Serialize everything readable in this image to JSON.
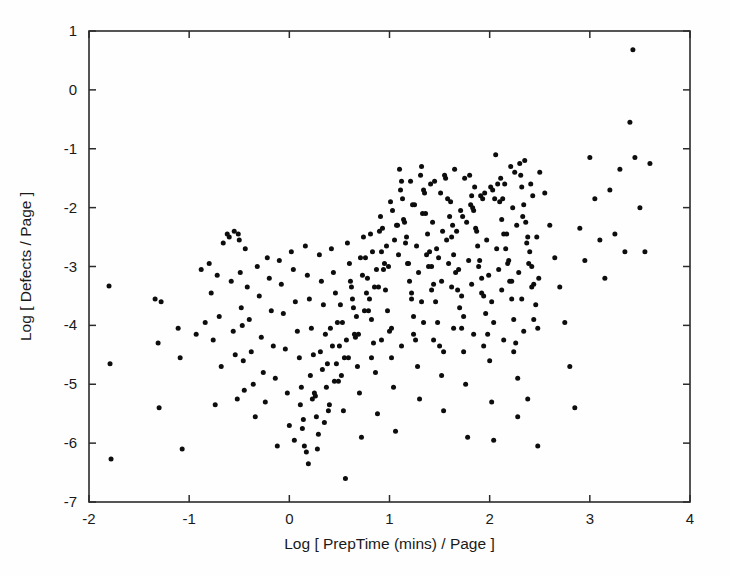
{
  "figure": {
    "background_color": "#fefefe",
    "foreground_color": "#1a1a1a",
    "marker_color": "#0d0d0d"
  },
  "axes": {
    "x_title": "Log [ PrepTime (mins) / Page ]",
    "y_title": "Log [ Defects / Page ]",
    "x_ticks": [
      "-2",
      "-1",
      "0",
      "1",
      "2",
      "3",
      "4"
    ],
    "y_ticks": [
      "1",
      "0",
      "-1",
      "-2",
      "-3",
      "-4",
      "-5",
      "-6",
      "-7"
    ]
  },
  "chart_data": {
    "type": "scatter",
    "title": "",
    "xlabel": "Log [ PrepTime (mins) / Page ]",
    "ylabel": "Log [ Defects / Page ]",
    "xlim": [
      -2,
      4
    ],
    "ylim": [
      -7,
      1
    ],
    "xticks": [
      -2,
      -1,
      0,
      1,
      2,
      3,
      4
    ],
    "yticks": [
      -7,
      -6,
      -5,
      -4,
      -3,
      -2,
      -1,
      0,
      1
    ],
    "grid": false,
    "legend": null,
    "marker": "filled-circle",
    "marker_size_px": 5,
    "n_points": 380,
    "x": [
      -1.8,
      -1.79,
      -1.78,
      -1.34,
      -1.31,
      -1.3,
      -1.28,
      -1.11,
      -1.09,
      -1.07,
      -0.93,
      -0.88,
      -0.84,
      -0.8,
      -0.78,
      -0.76,
      -0.74,
      -0.72,
      -0.7,
      -0.68,
      -0.66,
      -0.62,
      -0.6,
      -0.58,
      -0.56,
      -0.54,
      -0.52,
      -0.5,
      -0.49,
      -0.48,
      -0.47,
      -0.46,
      -0.45,
      -0.44,
      -0.42,
      -0.4,
      -0.38,
      -0.36,
      -0.34,
      -0.32,
      -0.3,
      -0.28,
      -0.26,
      -0.24,
      -0.22,
      -0.2,
      -0.18,
      -0.16,
      -0.14,
      -0.12,
      -0.1,
      -0.08,
      -0.06,
      -0.04,
      -0.02,
      0.0,
      0.02,
      0.04,
      0.06,
      0.08,
      0.1,
      0.12,
      0.14,
      0.16,
      0.18,
      0.2,
      0.22,
      0.24,
      0.26,
      0.28,
      0.3,
      0.32,
      0.34,
      0.36,
      0.38,
      0.4,
      0.42,
      0.44,
      0.46,
      0.48,
      0.5,
      0.52,
      0.54,
      0.56,
      0.58,
      0.6,
      0.62,
      0.64,
      0.66,
      0.68,
      0.7,
      0.72,
      0.74,
      0.76,
      0.78,
      0.8,
      0.82,
      0.84,
      0.86,
      0.88,
      0.9,
      0.92,
      0.94,
      0.96,
      0.98,
      1.0,
      1.02,
      1.04,
      1.06,
      1.08,
      1.1,
      1.12,
      1.14,
      1.16,
      1.18,
      1.2,
      1.22,
      1.24,
      1.26,
      1.28,
      1.3,
      1.32,
      1.34,
      1.36,
      1.38,
      1.4,
      1.42,
      1.44,
      1.46,
      1.48,
      1.5,
      1.52,
      1.54,
      1.56,
      1.58,
      1.6,
      1.62,
      1.64,
      1.66,
      1.68,
      1.7,
      1.72,
      1.74,
      1.76,
      1.78,
      1.8,
      1.82,
      1.84,
      1.86,
      1.88,
      1.9,
      1.92,
      1.94,
      1.96,
      1.98,
      2.0,
      2.02,
      2.04,
      2.06,
      2.08,
      2.1,
      2.12,
      2.14,
      2.16,
      2.18,
      2.2,
      2.22,
      2.24,
      2.26,
      2.28,
      2.3,
      2.32,
      2.34,
      2.36,
      2.38,
      2.4,
      2.42,
      2.44,
      2.46,
      2.48,
      2.5,
      2.55,
      2.6,
      2.65,
      2.7,
      2.75,
      2.8,
      2.85,
      2.9,
      2.95,
      3.0,
      3.05,
      3.1,
      3.15,
      3.2,
      3.25,
      3.3,
      3.35,
      3.4,
      3.43,
      3.45,
      3.5,
      3.55,
      3.6,
      -0.55,
      -0.51,
      0.05,
      0.15,
      0.25,
      0.35,
      0.45,
      0.55,
      0.65,
      0.75,
      0.85,
      0.95,
      1.05,
      1.15,
      1.25,
      1.35,
      1.45,
      1.55,
      1.65,
      1.75,
      1.85,
      1.95,
      2.05,
      2.15,
      2.25,
      2.35,
      0.11,
      0.21,
      0.31,
      0.41,
      0.51,
      0.61,
      0.71,
      0.81,
      0.91,
      1.01,
      1.11,
      1.21,
      1.31,
      1.41,
      1.51,
      1.61,
      1.71,
      1.81,
      1.91,
      2.01,
      2.11,
      2.21,
      2.31,
      2.41,
      0.13,
      0.23,
      0.33,
      0.43,
      0.53,
      0.63,
      0.73,
      0.83,
      0.93,
      1.03,
      1.13,
      1.23,
      1.33,
      1.43,
      1.53,
      1.63,
      1.73,
      1.83,
      1.93,
      2.03,
      2.13,
      2.23,
      2.33,
      2.43,
      0.17,
      0.27,
      0.37,
      0.47,
      0.57,
      0.67,
      0.77,
      0.87,
      0.97,
      1.07,
      1.17,
      1.27,
      1.37,
      1.47,
      1.57,
      1.67,
      1.77,
      1.87,
      1.97,
      2.07,
      2.17,
      2.27,
      2.37,
      2.47,
      0.19,
      0.29,
      0.39,
      0.49,
      0.59,
      0.69,
      0.79,
      0.89,
      0.99,
      1.09,
      1.19,
      1.29,
      1.39,
      1.49,
      1.59,
      1.69,
      1.79,
      1.89,
      1.99,
      2.09,
      2.19,
      2.29,
      2.39,
      2.49,
      1.22,
      1.32,
      1.42,
      1.52,
      1.62,
      1.72,
      1.82,
      1.92,
      2.02,
      2.12,
      2.22,
      2.32,
      2.42,
      0.82,
      0.92,
      1.02,
      1.12,
      1.24,
      1.34,
      1.44,
      1.54,
      1.64,
      1.74,
      1.84,
      1.94,
      2.04,
      2.14,
      2.24,
      2.34,
      2.44,
      2.28,
      2.38,
      2.48
    ],
    "y": [
      -3.33,
      -4.65,
      -6.27,
      -3.55,
      -4.3,
      -5.4,
      -3.6,
      -4.05,
      -4.55,
      -6.1,
      -4.15,
      -3.05,
      -3.95,
      -2.95,
      -3.45,
      -4.25,
      -5.35,
      -3.15,
      -3.85,
      -4.7,
      -2.6,
      -2.45,
      -2.5,
      -3.25,
      -4.1,
      -4.5,
      -5.25,
      -2.55,
      -3.1,
      -3.7,
      -4.0,
      -4.6,
      -5.1,
      -2.7,
      -3.35,
      -3.9,
      -4.45,
      -5.0,
      -5.55,
      -3.0,
      -3.5,
      -4.2,
      -4.8,
      -5.3,
      -2.85,
      -3.2,
      -3.75,
      -4.35,
      -4.9,
      -6.05,
      -2.9,
      -3.3,
      -3.8,
      -4.4,
      -5.15,
      -5.7,
      -2.75,
      -3.05,
      -3.6,
      -4.1,
      -4.55,
      -5.05,
      -5.6,
      -2.65,
      -3.15,
      -3.55,
      -4.05,
      -4.5,
      -5.2,
      -6.1,
      -2.8,
      -3.25,
      -3.65,
      -4.15,
      -4.65,
      -5.35,
      -2.7,
      -3.1,
      -3.45,
      -3.95,
      -4.35,
      -4.85,
      -5.45,
      -6.6,
      -2.6,
      -2.95,
      -3.35,
      -3.7,
      -4.2,
      -4.7,
      -5.15,
      -5.9,
      -2.5,
      -2.85,
      -3.2,
      -3.55,
      -3.9,
      -4.3,
      -4.8,
      -5.5,
      -2.4,
      -2.75,
      -3.05,
      -3.4,
      -3.75,
      -4.1,
      -4.55,
      -5.05,
      -5.8,
      -2.3,
      -1.35,
      -1.55,
      -2.2,
      -2.6,
      -2.95,
      -3.25,
      -3.55,
      -3.85,
      -4.25,
      -4.7,
      -5.25,
      -1.3,
      -1.7,
      -2.1,
      -2.45,
      -2.75,
      -3.0,
      -3.3,
      -3.6,
      -3.95,
      -4.35,
      -4.85,
      -5.45,
      -1.5,
      -1.85,
      -2.15,
      -2.5,
      -2.8,
      -3.1,
      -3.4,
      -3.7,
      -4.05,
      -4.45,
      -5.0,
      -5.9,
      -1.45,
      -1.8,
      -2.05,
      -2.35,
      -2.65,
      -2.9,
      -3.2,
      -3.5,
      -3.8,
      -4.15,
      -4.6,
      -5.3,
      -5.95,
      -1.1,
      -1.6,
      -1.9,
      -2.2,
      -2.45,
      -2.7,
      -2.95,
      -3.25,
      -3.55,
      -3.9,
      -4.3,
      -4.9,
      -1.25,
      -1.65,
      -1.95,
      -2.25,
      -2.5,
      -2.75,
      -3.0,
      -3.3,
      -3.65,
      -4.05,
      -1.4,
      -1.75,
      -2.3,
      -2.85,
      -3.35,
      -3.95,
      -4.7,
      -5.4,
      -2.35,
      -2.9,
      -1.15,
      -1.85,
      -2.55,
      -3.2,
      -1.7,
      -2.45,
      -1.35,
      -2.75,
      -0.55,
      0.68,
      -1.15,
      -2.0,
      -2.75,
      -1.25,
      -2.4,
      -2.45,
      -5.95,
      -6.05,
      -5.15,
      -5.65,
      -4.95,
      -4.55,
      -4.15,
      -3.75,
      -3.35,
      -2.95,
      -2.55,
      -2.25,
      -1.95,
      -1.75,
      -1.55,
      -1.45,
      -1.35,
      -1.5,
      -1.65,
      -1.75,
      -1.85,
      -1.6,
      -1.4,
      -1.2,
      -5.35,
      -4.85,
      -4.45,
      -4.05,
      -3.65,
      -3.25,
      -2.85,
      -2.45,
      -2.15,
      -1.9,
      -1.7,
      -1.55,
      -1.45,
      -1.6,
      -1.75,
      -1.9,
      -2.05,
      -1.95,
      -1.8,
      -1.65,
      -1.5,
      -1.3,
      -1.45,
      -1.6,
      -5.75,
      -5.25,
      -4.75,
      -4.35,
      -3.95,
      -3.55,
      -3.15,
      -2.75,
      -2.35,
      -2.05,
      -1.85,
      -1.95,
      -2.1,
      -2.25,
      -2.4,
      -2.3,
      -2.15,
      -2.0,
      -1.85,
      -1.7,
      -1.85,
      -2.0,
      -2.15,
      -1.8,
      -6.15,
      -5.55,
      -5.05,
      -4.65,
      -4.25,
      -3.85,
      -3.45,
      -3.05,
      -2.65,
      -2.3,
      -2.5,
      -2.65,
      -2.8,
      -2.7,
      -2.55,
      -2.4,
      -2.25,
      -2.4,
      -2.55,
      -2.7,
      -2.45,
      -2.3,
      -2.6,
      -2.5,
      -6.35,
      -5.85,
      -5.45,
      -4.95,
      -4.55,
      -4.15,
      -3.75,
      -3.35,
      -3.0,
      -2.8,
      -2.95,
      -3.1,
      -3.0,
      -2.85,
      -2.95,
      -3.05,
      -2.9,
      -3.0,
      -3.15,
      -3.05,
      -2.9,
      -3.1,
      -2.95,
      -3.2,
      -3.45,
      -3.6,
      -3.4,
      -3.25,
      -3.35,
      -3.5,
      -3.3,
      -3.45,
      -3.6,
      -3.4,
      -3.25,
      -3.55,
      -3.35,
      -4.55,
      -4.25,
      -4.05,
      -4.35,
      -4.15,
      -3.95,
      -4.25,
      -4.45,
      -4.05,
      -3.85,
      -4.15,
      -4.35,
      -3.95,
      -4.25,
      -4.45,
      -4.1,
      -3.9,
      -5.55,
      -5.25,
      -6.05
    ]
  }
}
